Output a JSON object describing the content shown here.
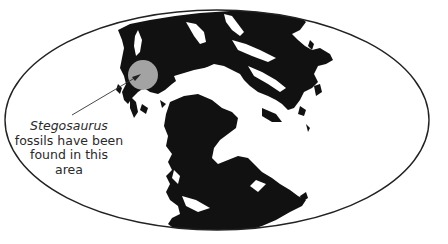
{
  "map": {
    "type": "paleogeographic world map",
    "projection": "elliptical (Mollweide-style)",
    "land_color": "#111111",
    "ocean_color": "#ffffff",
    "outline_color": "#222222",
    "highlight_color": "#a3a3a3"
  },
  "annotation": {
    "species": "Stegosaurus",
    "line1": "fossils have been",
    "line2": "found in this",
    "line3": "area",
    "pointer": "arrow-to-highlighted-region"
  }
}
